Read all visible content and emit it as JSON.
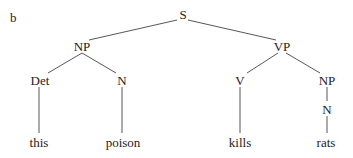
{
  "panel_label": "b",
  "tree": {
    "nodes": [
      {
        "id": "S",
        "label": "S",
        "x": 183,
        "y": 14
      },
      {
        "id": "NP1",
        "label": "NP",
        "x": 82,
        "y": 46
      },
      {
        "id": "VP",
        "label": "VP",
        "x": 282,
        "y": 46
      },
      {
        "id": "Det",
        "label": "Det",
        "x": 40,
        "y": 80
      },
      {
        "id": "N1",
        "label": "N",
        "x": 122,
        "y": 80
      },
      {
        "id": "V",
        "label": "V",
        "x": 240,
        "y": 80
      },
      {
        "id": "NP2",
        "label": "NP",
        "x": 327,
        "y": 80
      },
      {
        "id": "N2",
        "label": "N",
        "x": 327,
        "y": 109
      },
      {
        "id": "w_this",
        "label": "this",
        "x": 39,
        "y": 142
      },
      {
        "id": "w_poison",
        "label": "poison",
        "x": 123,
        "y": 142
      },
      {
        "id": "w_kills",
        "label": "kills",
        "x": 240,
        "y": 142
      },
      {
        "id": "w_rats",
        "label": "rats",
        "x": 326,
        "y": 142
      }
    ],
    "edges": [
      {
        "x1": 177,
        "y1": 20,
        "x2": 89,
        "y2": 40
      },
      {
        "x1": 188,
        "y1": 20,
        "x2": 276,
        "y2": 40
      },
      {
        "x1": 82,
        "y1": 53,
        "x2": 48,
        "y2": 73
      },
      {
        "x1": 82,
        "y1": 53,
        "x2": 116,
        "y2": 73
      },
      {
        "x1": 278,
        "y1": 53,
        "x2": 247,
        "y2": 73
      },
      {
        "x1": 286,
        "y1": 53,
        "x2": 320,
        "y2": 73
      },
      {
        "x1": 39,
        "y1": 87,
        "x2": 39,
        "y2": 133
      },
      {
        "x1": 122,
        "y1": 87,
        "x2": 122,
        "y2": 133
      },
      {
        "x1": 240,
        "y1": 87,
        "x2": 240,
        "y2": 133
      },
      {
        "x1": 327,
        "y1": 87,
        "x2": 327,
        "y2": 101
      },
      {
        "x1": 327,
        "y1": 116,
        "x2": 327,
        "y2": 133
      }
    ]
  }
}
